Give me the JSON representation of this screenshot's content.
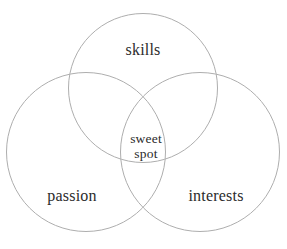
{
  "diagram": {
    "type": "venn-3-circle",
    "background_color": "#ffffff",
    "stroke_color": "#aeaeae",
    "text_color": "#2b2b2b",
    "circles": [
      {
        "id": "skills",
        "label": "skills",
        "cx": 143,
        "cy": 88,
        "r": 75
      },
      {
        "id": "passion",
        "label": "passion",
        "cx": 86,
        "cy": 152,
        "r": 80
      },
      {
        "id": "interests",
        "label": "interests",
        "cx": 200,
        "cy": 152,
        "r": 80
      }
    ],
    "labels": {
      "top": "skills",
      "bottom_left": "passion",
      "bottom_right": "interests",
      "center_line_1": "sweet",
      "center_line_2": "spot"
    }
  }
}
